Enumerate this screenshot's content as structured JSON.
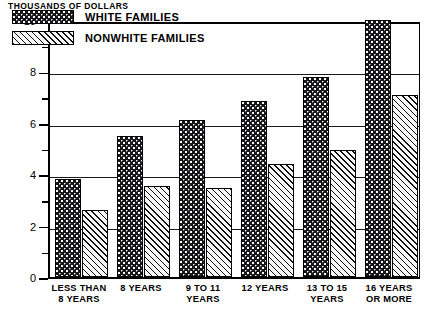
{
  "chart_data": {
    "type": "bar",
    "title": "",
    "ylabel": "THOUSANDS OF DOLLARS",
    "xlabel": "",
    "ylim": [
      0,
      10
    ],
    "grid": true,
    "legend_position": "top-left",
    "y_major_ticks": [
      "0",
      "2",
      "4",
      "6",
      "8",
      "10"
    ],
    "y_minor_ticks": [
      "1",
      "3",
      "5",
      "7",
      "9"
    ],
    "categories": [
      "LESS THAN\n8 YEARS",
      "8 YEARS",
      "9 TO 11\nYEARS",
      "12 YEARS",
      "13 TO 15\nYEARS",
      "16 YEARS\nOR MORE"
    ],
    "category_lines": [
      [
        "LESS THAN",
        "8 YEARS"
      ],
      [
        "8 YEARS"
      ],
      [
        "9 TO 11",
        "YEARS"
      ],
      [
        "12 YEARS"
      ],
      [
        "13 TO 15",
        "YEARS"
      ],
      [
        "16 YEARS",
        "OR MORE"
      ]
    ],
    "series": [
      {
        "name": "WHITE FAMILIES",
        "pattern": "dark-dotted",
        "values": [
          3.8,
          5.5,
          6.1,
          6.85,
          7.8,
          10.0
        ]
      },
      {
        "name": "NONWHITE FAMILIES",
        "pattern": "diagonal-hatch",
        "values": [
          2.6,
          3.55,
          3.45,
          4.4,
          4.95,
          7.1
        ]
      }
    ]
  },
  "legend": {
    "items": [
      {
        "label": "WHITE FAMILIES",
        "pattern": "dark-dotted"
      },
      {
        "label": "NONWHITE FAMILIES",
        "pattern": "diagonal-hatch"
      }
    ]
  },
  "colors": {
    "white_families": "#17171a",
    "nonwhite_families": "#f2f2f2",
    "axis": "#000000",
    "background": "#ffffff"
  }
}
